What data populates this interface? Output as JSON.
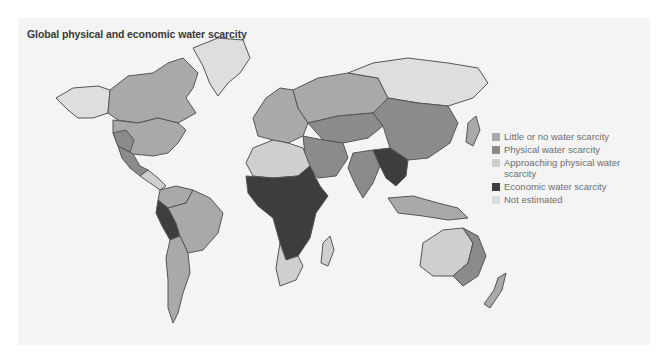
{
  "title": "Global physical and economic water scarcity",
  "legend": {
    "items": [
      {
        "key": "little",
        "label": "Little or no water scarcity",
        "color": "#a9a9a9"
      },
      {
        "key": "physical",
        "label": "Physical water scarcity",
        "color": "#8b8b8b"
      },
      {
        "key": "approaching",
        "label": "Approaching physical water scarcity",
        "color": "#cfcfcf"
      },
      {
        "key": "economic",
        "label": "Economic water scarcity",
        "color": "#3d3d3d"
      },
      {
        "key": "not_estimated",
        "label": "Not estimated",
        "color": "#dedede"
      }
    ]
  },
  "regions": [
    {
      "name": "Alaska",
      "category": "not_estimated"
    },
    {
      "name": "Canada",
      "category": "little"
    },
    {
      "name": "Greenland",
      "category": "not_estimated"
    },
    {
      "name": "United States",
      "category": "little"
    },
    {
      "name": "US Southwest",
      "category": "physical"
    },
    {
      "name": "Mexico",
      "category": "physical"
    },
    {
      "name": "Central America",
      "category": "approaching"
    },
    {
      "name": "Northern South America",
      "category": "little"
    },
    {
      "name": "Andes (Peru/Bolivia)",
      "category": "economic"
    },
    {
      "name": "Brazil",
      "category": "little"
    },
    {
      "name": "Southern Cone",
      "category": "little"
    },
    {
      "name": "Europe",
      "category": "little"
    },
    {
      "name": "Russia (west)",
      "category": "little"
    },
    {
      "name": "Siberia",
      "category": "not_estimated"
    },
    {
      "name": "Central Asia",
      "category": "physical"
    },
    {
      "name": "China",
      "category": "physical"
    },
    {
      "name": "Middle East",
      "category": "physical"
    },
    {
      "name": "North Africa",
      "category": "approaching"
    },
    {
      "name": "Sub-Saharan Africa",
      "category": "economic"
    },
    {
      "name": "Southern Africa",
      "category": "approaching"
    },
    {
      "name": "Madagascar",
      "category": "approaching"
    },
    {
      "name": "India",
      "category": "physical"
    },
    {
      "name": "Bangladesh / SE Asia",
      "category": "economic"
    },
    {
      "name": "Indonesia",
      "category": "little"
    },
    {
      "name": "Australia (interior)",
      "category": "approaching"
    },
    {
      "name": "Australia (east)",
      "category": "physical"
    },
    {
      "name": "New Zealand",
      "category": "little"
    },
    {
      "name": "Japan",
      "category": "little"
    }
  ]
}
